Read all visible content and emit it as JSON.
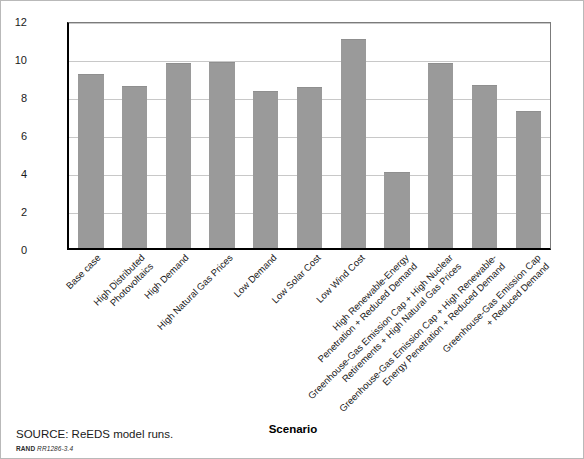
{
  "figure": {
    "source_note": "SOURCE: ReEDS model runs.",
    "rand_mark": "RAND",
    "rand_number": "RR1286-3.4"
  },
  "chart_data": {
    "type": "bar",
    "title": "",
    "xlabel": "Scenario",
    "ylabel": "Percentage change",
    "ylim": [
      0,
      12
    ],
    "yticks": [
      0,
      2,
      4,
      6,
      8,
      10,
      12
    ],
    "ytick_labels": [
      "0",
      "2",
      "4",
      "6",
      "8",
      "10",
      "12"
    ],
    "grid": true,
    "legend": "none",
    "bar_color": "#9a9a9a",
    "categories": [
      "Base case",
      "High Distributed\nPhotovoltaics",
      "High Demand",
      "High Natural Gas Prices",
      "Low Demand",
      "Low Solar Cost",
      "Low Wind Cost",
      "High Renewable-Energy\nPenetration + Reduced Demand",
      "Greenhouse-Gas Emission Cap + High Nuclear\nRetirements + High Natural Gas Prices",
      "Greenhouse-Gas Emission Cap + High Renewable-\nEnergy Penetration + Reduced Demand",
      "Greenhouse-Gas Emission Cap\n+ Reduced Demand"
    ],
    "values": [
      9.15,
      8.55,
      9.75,
      9.8,
      8.25,
      8.5,
      11.0,
      4.0,
      9.75,
      8.6,
      7.2
    ]
  }
}
